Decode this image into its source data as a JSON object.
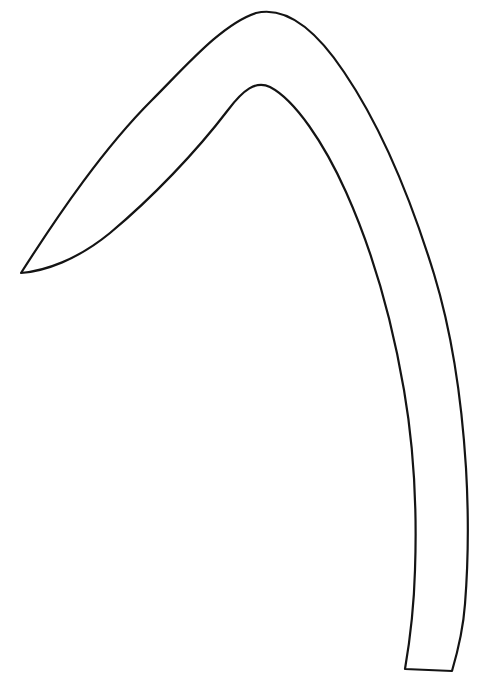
{
  "document": {
    "title": "Curved Horn Outline Drawing",
    "kind": "line-art-outline",
    "background_color": "#ffffff",
    "stroke_color": "#141414",
    "stroke_width": 2.2,
    "canvas": {
      "width": 487,
      "height": 688
    },
    "text_content": [],
    "labels": []
  },
  "figure": {
    "name": "curved-tapering-horn-outline",
    "viewbox": "0 0 487 688",
    "key_points": {
      "tip": {
        "x": 21,
        "y": 273
      },
      "outer_apex": {
        "x": 256,
        "y": 13
      },
      "inner_apex": {
        "x": 248,
        "y": 86
      },
      "bottom_left_corner": {
        "x": 405,
        "y": 669
      },
      "bottom_right_corner": {
        "x": 452,
        "y": 671
      },
      "outer_max_x": {
        "x": 468,
        "y": 540
      }
    },
    "paths": {
      "body_outline": "M 21 273 C 60 212 104 148 152 100 C 186 66 222 24 256 13 C 286 6 316 30 344 72 C 382 128 410 196 434 274 C 452 333 462 404 466 468 C 469 520 468 566 465 604 C 463 632 457 654 452 671 L 405 669 C 410 640 414 606 415 570 C 417 512 414 448 404 390 C 392 320 372 250 346 192 C 324 143 295 100 270 87 C 256 80 243 90 228 110 C 196 152 152 198 110 233 C 77 260 45 271 21 273 Z"
    }
  }
}
